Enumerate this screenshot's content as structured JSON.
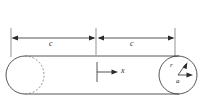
{
  "figure": {
    "type": "engineering-diagram",
    "background_color": "#ffffff",
    "line_color": "#2b2b2b",
    "hidden_line_color": "#6e6e6e"
  },
  "dimensions": {
    "left_segment_label": "c",
    "right_segment_label": "c"
  },
  "axes": {
    "x_label": "x"
  },
  "cross_section": {
    "radius_label": "r",
    "offset_label": "a"
  },
  "geometry": {
    "canvas_width": 203,
    "canvas_height": 101,
    "dimension_line_y": 38,
    "witness_left_x": 11,
    "witness_mid_x": 96,
    "witness_right_x": 175,
    "body_top_y": 56,
    "body_bottom_y": 94,
    "left_circle_cx": 26,
    "left_circle_cy": 75,
    "left_circle_r": 19,
    "right_circle_cx": 178,
    "right_circle_cy": 75,
    "right_circle_r": 19
  }
}
